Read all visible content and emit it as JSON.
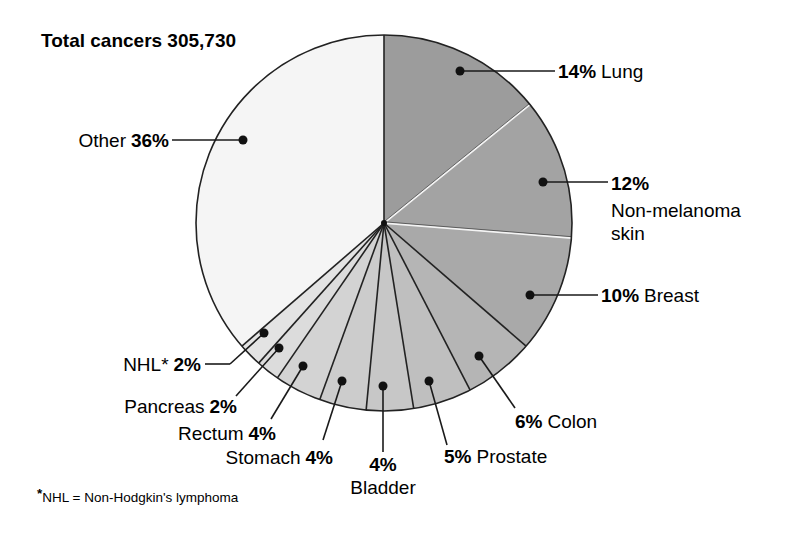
{
  "chart_data": {
    "type": "pie",
    "title": "Total cancers 305,730",
    "total": 305730,
    "start_angle_deg": 0,
    "direction": "clockwise",
    "slices": [
      {
        "name": "Lung",
        "value": 14,
        "label_text": "14% Lung",
        "color": "#9c9c9c",
        "separator": "#f2f2f2"
      },
      {
        "name": "Non-melanoma skin",
        "value": 12,
        "label_text": "12% Non-melanoma skin",
        "color": "#a3a3a3",
        "separator": "#f2f2f2"
      },
      {
        "name": "Breast",
        "value": 10,
        "label_text": "10% Breast",
        "color": "#a9a9a9",
        "separator": "#222222"
      },
      {
        "name": "Colon",
        "value": 6,
        "label_text": "6% Colon",
        "color": "#b5b5b5",
        "separator": "#222222"
      },
      {
        "name": "Prostate",
        "value": 5,
        "label_text": "5% Prostate",
        "color": "#bfbfbf",
        "separator": "#222222"
      },
      {
        "name": "Bladder",
        "value": 4,
        "label_text": "4% Bladder",
        "color": "#c7c7c7",
        "separator": "#222222"
      },
      {
        "name": "Stomach",
        "value": 4,
        "label_text": "Stomach 4%",
        "color": "#cccccc",
        "separator": "#222222"
      },
      {
        "name": "Rectum",
        "value": 4,
        "label_text": "Rectum 4%",
        "color": "#d3d3d3",
        "separator": "#222222"
      },
      {
        "name": "Pancreas",
        "value": 2,
        "label_text": "Pancreas 2%",
        "color": "#dcdcdc",
        "separator": "#222222"
      },
      {
        "name": "NHL*",
        "value": 2,
        "label_text": "NHL* 2%",
        "color": "#e3e3e3",
        "separator": "#222222"
      },
      {
        "name": "Other",
        "value": 36,
        "label_text": "Other 36%",
        "color": "#f5f5f5",
        "separator": "#222222"
      }
    ],
    "footnote": "*NHL = Non-Hodgkin's lymphoma",
    "legend": "none (direct callout labels)"
  },
  "labels": {
    "title": "Total cancers 305,730",
    "lung_pct": "14%",
    "lung_name": "Lung",
    "skin_pct": "12%",
    "skin_name_1": "Non-melanoma",
    "skin_name_2": "skin",
    "breast_pct": "10%",
    "breast_name": "Breast",
    "colon_pct": "6%",
    "colon_name": "Colon",
    "prostate_pct": "5%",
    "prostate_name": "Prostate",
    "bladder_pct": "4%",
    "bladder_name": "Bladder",
    "stomach_name": "Stomach",
    "stomach_pct": "4%",
    "rectum_name": "Rectum",
    "rectum_pct": "4%",
    "pancreas_name": "Pancreas",
    "pancreas_pct": "2%",
    "nhl_name": "NHL*",
    "nhl_pct": "2%",
    "other_name": "Other",
    "other_pct": "36%",
    "footnote_star": "*",
    "footnote_text": "NHL = Non-Hodgkin's lymphoma"
  }
}
